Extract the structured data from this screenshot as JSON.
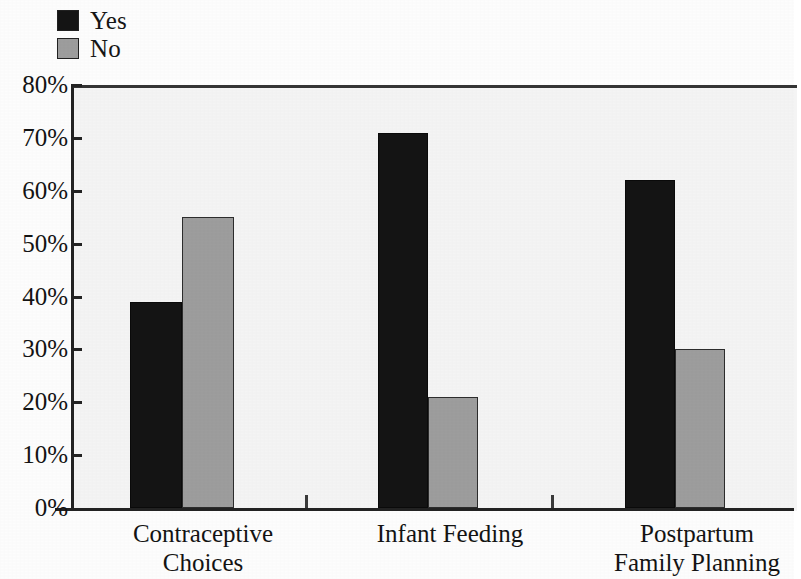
{
  "chart_data": {
    "type": "bar",
    "title": "",
    "subtitle": "",
    "xlabel": "",
    "ylabel": "",
    "categories": [
      "Contraceptive Choices",
      "Infant Feeding",
      "Postpartum Family Planning"
    ],
    "category_lines": [
      [
        "Contraceptive",
        "Choices"
      ],
      [
        "Infant Feeding",
        ""
      ],
      [
        "Postpartum",
        "Family Planning"
      ]
    ],
    "series": [
      {
        "name": "Yes",
        "color": "#141414",
        "values": [
          39,
          71,
          62
        ]
      },
      {
        "name": "No",
        "color": "#9d9d9d",
        "values": [
          55,
          21,
          30
        ]
      }
    ],
    "ylim": [
      0,
      80
    ],
    "ytick_values": [
      0,
      10,
      20,
      30,
      40,
      50,
      60,
      70,
      80
    ],
    "ytick_labels": [
      "0%",
      "10%",
      "20%",
      "30%",
      "40%",
      "50%",
      "60%",
      "70%",
      "80%"
    ],
    "grid": false,
    "legend_position": "top-left",
    "value_suffix": "%"
  },
  "legend": {
    "items": [
      {
        "label": "Yes",
        "swatch_color": "#141414",
        "icon": "legend-swatch-yes"
      },
      {
        "label": "No",
        "swatch_color": "#9d9d9d",
        "icon": "legend-swatch-no"
      }
    ]
  }
}
